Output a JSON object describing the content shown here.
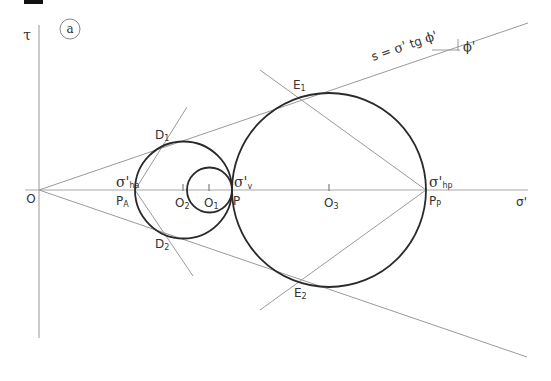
{
  "figure": {
    "panel_label": "a",
    "axes": {
      "y_label": "τ",
      "x_label": "σ'",
      "origin_label": "O"
    },
    "failure_envelope": {
      "equation_parts": {
        "s": "s = ",
        "sigma": "σ'",
        "tg": " tg ",
        "phi": "ϕ'"
      },
      "angle_label": "ϕ'"
    },
    "points": {
      "PA": {
        "main": "P",
        "sub": "A"
      },
      "P": {
        "main": "P"
      },
      "PP": {
        "main": "P",
        "sub": "P"
      },
      "O1": {
        "main": "O",
        "sub": "1"
      },
      "O2": {
        "main": "O",
        "sub": "2"
      },
      "O3": {
        "main": "O",
        "sub": "3"
      },
      "D1": {
        "main": "D",
        "sub": "1"
      },
      "D2": {
        "main": "D",
        "sub": "2"
      },
      "E1": {
        "main": "E",
        "sub": "1"
      },
      "E2": {
        "main": "E",
        "sub": "2"
      }
    },
    "stresses": {
      "sigma_ha": {
        "main": "σ'",
        "sub": "ha"
      },
      "sigma_v": {
        "main": "σ'",
        "sub": "v"
      },
      "sigma_hp": {
        "main": "σ'",
        "sub": "hp"
      }
    },
    "colors": {
      "circle_stroke": "#2a2a2a",
      "line_stroke": "#9a9a9a",
      "axis_stroke": "#a0a0a0",
      "text": "#333333"
    }
  }
}
